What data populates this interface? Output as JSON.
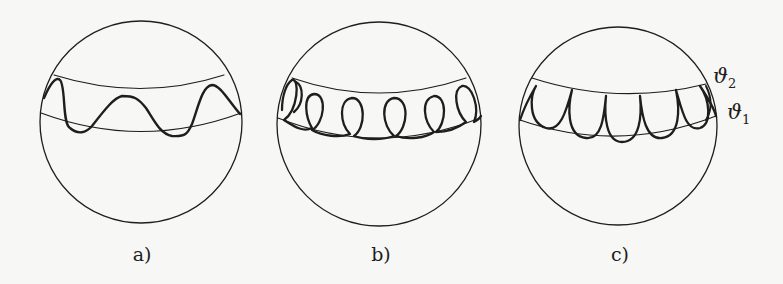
{
  "figure": {
    "colors": {
      "background": "#f7f7f5",
      "stroke": "#1e1e1e"
    },
    "panels": [
      {
        "id": "a",
        "label": "a)",
        "curve_type": "wave",
        "center": [
          141,
          122
        ],
        "radius": 101
      },
      {
        "id": "b",
        "label": "b)",
        "curve_type": "loops",
        "center": [
          379,
          124
        ],
        "radius": 102
      },
      {
        "id": "c",
        "label": "c)",
        "curve_type": "cusps",
        "center": [
          618,
          126
        ],
        "radius": 99
      }
    ],
    "annotations": {
      "theta2": {
        "symbol": "ϑ",
        "sub": "2"
      },
      "theta1": {
        "symbol": "ϑ",
        "sub": "1"
      }
    }
  }
}
